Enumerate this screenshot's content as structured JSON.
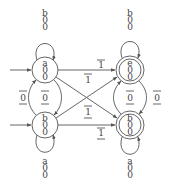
{
  "diagram": {
    "states": [
      {
        "id": "q0",
        "cx": 45,
        "cy": 70,
        "lines": [
          "a",
          "0",
          "0"
        ],
        "accepting": false,
        "initial": true
      },
      {
        "id": "q1",
        "cx": 45,
        "cy": 125,
        "lines": [
          "b",
          "0",
          "0"
        ],
        "accepting": false,
        "initial": true
      },
      {
        "id": "q2",
        "cx": 130,
        "cy": 70,
        "lines": [
          "e",
          "0",
          "0"
        ],
        "accepting": true,
        "initial": false
      },
      {
        "id": "q3",
        "cx": 130,
        "cy": 125,
        "lines": [
          "b",
          "0",
          "0"
        ],
        "accepting": true,
        "initial": false
      }
    ],
    "self_loops": [
      {
        "state": "q0",
        "side": "top",
        "lines": [
          "b",
          "0",
          "0"
        ]
      },
      {
        "state": "q1",
        "side": "bottom",
        "lines": [
          "a",
          "0",
          "0"
        ]
      },
      {
        "state": "q2",
        "side": "top",
        "lines": [
          "b",
          "0",
          "0"
        ]
      },
      {
        "state": "q3",
        "side": "bottom",
        "lines": [
          "a",
          "0",
          "0"
        ]
      }
    ],
    "edges": [
      {
        "from": "q0",
        "to": "q1",
        "label": "0",
        "overline": true,
        "underline": true
      },
      {
        "from": "q1",
        "to": "q0",
        "label": "0",
        "overline": true,
        "underline": true
      },
      {
        "from": "q2",
        "to": "q3",
        "label": "0",
        "overline": true,
        "underline": true
      },
      {
        "from": "q3",
        "to": "q2",
        "label": "0",
        "overline": true,
        "underline": true
      },
      {
        "from": "q0",
        "to": "q2",
        "label": "1",
        "overline": true,
        "underline": false
      },
      {
        "from": "q0",
        "to": "q3",
        "label": "1",
        "overline": true,
        "underline": false
      },
      {
        "from": "q1",
        "to": "q2",
        "label": "1",
        "overline": true,
        "underline": true
      },
      {
        "from": "q1",
        "to": "q3",
        "label": "1",
        "overline": true,
        "underline": true
      }
    ],
    "labels": {
      "q0_l1": "a",
      "q0_l2": "0",
      "q0_l3": "0",
      "q1_l1": "b",
      "q1_l2": "0",
      "q1_l3": "0",
      "q2_l1": "e",
      "q2_l2": "0",
      "q2_l3": "0",
      "q3_l1": "b",
      "q3_l2": "0",
      "q3_l3": "0",
      "loop0_l1": "b",
      "loop0_l2": "0",
      "loop0_l3": "0",
      "loop1_l1": "a",
      "loop1_l2": "0",
      "loop1_l3": "0",
      "loop2_l1": "b",
      "loop2_l2": "0",
      "loop2_l3": "0",
      "loop3_l1": "a",
      "loop3_l2": "0",
      "loop3_l3": "0",
      "left_outer": "0",
      "left_inner": "0",
      "right_inner": "0",
      "right_outer": "0",
      "top_straight": "1",
      "cross_upper": "1",
      "cross_lower": "1",
      "bottom_straight": "1"
    },
    "color": "#555555"
  }
}
